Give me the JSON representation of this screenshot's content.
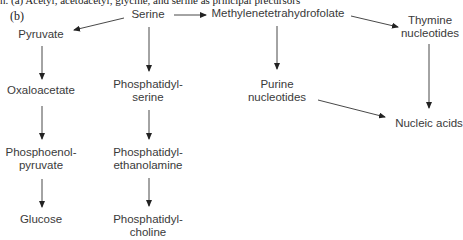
{
  "figure": {
    "top_cut_text": "n. (a) Acetyl, acetoacetyl, glycine, and serine as principal precursors",
    "panel_label": "(b)"
  },
  "nodes": {
    "serine": {
      "lines": [
        "Serine"
      ]
    },
    "methylenethf": {
      "lines": [
        "Methylenetetrahydrofolate"
      ]
    },
    "thymine": {
      "lines": [
        "Thymine",
        "nucleotides"
      ]
    },
    "pyruvate": {
      "lines": [
        "Pyruvate"
      ]
    },
    "oxaloacetate": {
      "lines": [
        "Oxaloacetate"
      ]
    },
    "ps": {
      "lines": [
        "Phosphatidyl-",
        "serine"
      ]
    },
    "purine": {
      "lines": [
        "Purine",
        "nucleotides"
      ]
    },
    "nucleic": {
      "lines": [
        "Nucleic acids"
      ]
    },
    "pep": {
      "lines": [
        "Phosphoenol-",
        "pyruvate"
      ]
    },
    "pe": {
      "lines": [
        "Phosphatidyl-",
        "ethanolamine"
      ]
    },
    "glucose": {
      "lines": [
        "Glucose"
      ]
    },
    "pc": {
      "lines": [
        "Phosphatidyl-",
        "choline"
      ]
    }
  },
  "edges": [
    {
      "from": "Serine",
      "to": "Pyruvate"
    },
    {
      "from": "Serine",
      "to": "Methylenetetrahydrofolate"
    },
    {
      "from": "Serine",
      "to": "Phosphatidylserine"
    },
    {
      "from": "Methylenetetrahydrofolate",
      "to": "Thymine nucleotides"
    },
    {
      "from": "Methylenetetrahydrofolate",
      "to": "Purine nucleotides"
    },
    {
      "from": "Thymine nucleotides",
      "to": "Nucleic acids"
    },
    {
      "from": "Purine nucleotides",
      "to": "Nucleic acids"
    },
    {
      "from": "Pyruvate",
      "to": "Oxaloacetate"
    },
    {
      "from": "Oxaloacetate",
      "to": "Phosphoenolpyruvate"
    },
    {
      "from": "Phosphoenolpyruvate",
      "to": "Glucose"
    },
    {
      "from": "Phosphatidylserine",
      "to": "Phosphatidylethanolamine"
    },
    {
      "from": "Phosphatidylethanolamine",
      "to": "Phosphatidylcholine"
    }
  ],
  "colors": {
    "text": "#3a3a3a",
    "arrow": "#222222",
    "background": "#ffffff"
  }
}
